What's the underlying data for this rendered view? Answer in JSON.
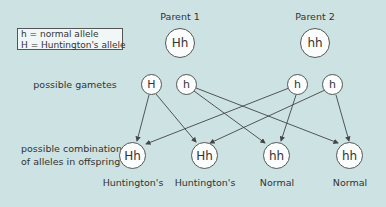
{
  "legend": {
    "line1": "h = normal allele",
    "line2": "H = Huntington's allele"
  },
  "parents": [
    {
      "label": "Parent 1",
      "genotype": "Hh"
    },
    {
      "label": "Parent 2",
      "genotype": "hh"
    }
  ],
  "row_labels": {
    "gametes": "possible gametes",
    "offspring_line1": "possible combination",
    "offspring_line2": "of alleles in offspring"
  },
  "gametes": [
    {
      "allele": "H",
      "parent": 1
    },
    {
      "allele": "h",
      "parent": 1
    },
    {
      "allele": "h",
      "parent": 2
    },
    {
      "allele": "h",
      "parent": 2
    }
  ],
  "offspring": [
    {
      "genotype": "Hh",
      "phenotype": "Huntington's"
    },
    {
      "genotype": "Hh",
      "phenotype": "Huntington's"
    },
    {
      "genotype": "hh",
      "phenotype": "Normal"
    },
    {
      "genotype": "hh",
      "phenotype": "Normal"
    }
  ],
  "colors": {
    "background": "#cde2e2",
    "node_fill": "#fbfdfd",
    "stroke": "#555555"
  }
}
